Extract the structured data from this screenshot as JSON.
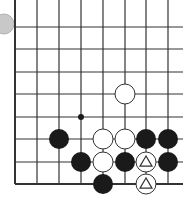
{
  "diagram": {
    "type": "go-board-fragment",
    "columns_x": [
      15,
      37,
      59,
      81,
      103,
      125,
      146,
      168
    ],
    "rows_y": [
      27,
      49,
      72,
      94,
      117,
      139,
      162,
      184
    ],
    "right_extent": 183,
    "stone_radius": 10,
    "colors": {
      "black": "#1a1a1a",
      "white": "#ffffff",
      "line": "#333333",
      "marker_stone": "#c8c8c8"
    },
    "marker_stone": {
      "x": 4,
      "y": 24,
      "r": 10
    },
    "star_points": [
      {
        "col": 3,
        "row": 4
      }
    ],
    "stones": [
      {
        "col": 5,
        "row": 3,
        "color": "white",
        "mark": ""
      },
      {
        "col": 2,
        "row": 5,
        "color": "black",
        "mark": ""
      },
      {
        "col": 4,
        "row": 5,
        "color": "white",
        "mark": ""
      },
      {
        "col": 5,
        "row": 5,
        "color": "white",
        "mark": ""
      },
      {
        "col": 6,
        "row": 5,
        "color": "black",
        "mark": ""
      },
      {
        "col": 7,
        "row": 5,
        "color": "black",
        "mark": ""
      },
      {
        "col": 3,
        "row": 6,
        "color": "black",
        "mark": ""
      },
      {
        "col": 4,
        "row": 6,
        "color": "white",
        "mark": ""
      },
      {
        "col": 5,
        "row": 6,
        "color": "black",
        "mark": ""
      },
      {
        "col": 6,
        "row": 6,
        "color": "white",
        "mark": "triangle"
      },
      {
        "col": 7,
        "row": 6,
        "color": "black",
        "mark": ""
      },
      {
        "col": 4,
        "row": 7,
        "color": "black",
        "mark": ""
      },
      {
        "col": 6,
        "row": 7,
        "color": "white",
        "mark": "triangle"
      }
    ]
  }
}
